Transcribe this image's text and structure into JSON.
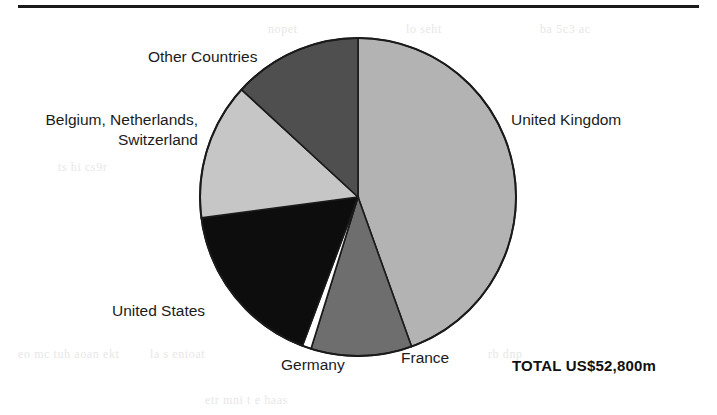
{
  "figure": {
    "total_label": "TOTAL US$52,800m",
    "rule": "top-horizontal-rule"
  },
  "chart_data": {
    "type": "pie",
    "title": "",
    "subtitle": "",
    "xlabel": "",
    "ylabel": "",
    "units": "US$ million",
    "total": "TOTAL US$52,800m",
    "total_value": 52800,
    "legend": "none-inline-labels",
    "start_angle_deg": 0,
    "direction": "clockwise",
    "categories": [
      "United Kingdom",
      "France",
      "Germany",
      "United States",
      "Belgium, Netherlands, Switzerland",
      "Other Countries"
    ],
    "values": [
      44.5,
      10.3,
      0.9,
      17.2,
      13.9,
      13.2
    ],
    "value_unit": "percent",
    "slices": [
      {
        "label": "United Kingdom",
        "percent": 44.5,
        "start_deg": 0,
        "end_deg": 160.2,
        "color": "#b3b3b3",
        "label_position": "right"
      },
      {
        "label": "France",
        "percent": 10.3,
        "start_deg": 160.2,
        "end_deg": 197.3,
        "color": "#6e6e6e",
        "label_position": "bottom-right"
      },
      {
        "label": "Germany",
        "percent": 0.9,
        "start_deg": 197.3,
        "end_deg": 200.6,
        "color": "#ffffff",
        "label_position": "bottom"
      },
      {
        "label": "United States",
        "percent": 17.2,
        "start_deg": 200.6,
        "end_deg": 262.5,
        "color": "#0d0d0d",
        "label_position": "left-bottom"
      },
      {
        "label": "Belgium, Netherlands, Switzerland",
        "percent": 13.9,
        "start_deg": 262.5,
        "end_deg": 312.5,
        "color": "#c6c6c6",
        "label_position": "left"
      },
      {
        "label": "Other Countries",
        "percent": 13.2,
        "start_deg": 312.5,
        "end_deg": 360,
        "color": "#4f4f4f",
        "label_position": "top-left"
      }
    ]
  },
  "labels": {
    "other_countries": "Other Countries",
    "benelux_line1": "Belgium, Netherlands,",
    "benelux_line2": "Switzerland",
    "united_kingdom": "United Kingdom",
    "united_states": "United States",
    "germany": "Germany",
    "france": "France"
  },
  "bleed_text": {
    "a": "nopet",
    "b": "lo seht",
    "c": "ba 5c3 ac",
    "d": "ts hi  cs9r",
    "e": "eo  mc  tuh aoan    ekt",
    "f": "la s  enioat",
    "g": "rb  dnp",
    "h": "etr  mni  t e  haas"
  }
}
